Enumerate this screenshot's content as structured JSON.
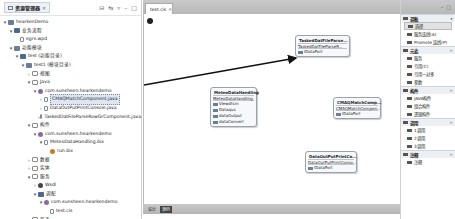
{
  "explorer": {
    "tab_label": "资源管理器",
    "tab_close": "✕",
    "toolbar_icons": [
      "collapse-all-icon",
      "link-editor-icon",
      "view-menu-icon",
      "minimize-icon",
      "maximize-icon"
    ],
    "tree": [
      {
        "indent": 0,
        "twisty": "▾",
        "icon": "project",
        "label": "hearkenDemo"
      },
      {
        "indent": 1,
        "twisty": "▾",
        "icon": "flow",
        "label": "业务流程"
      },
      {
        "indent": 2,
        "twisty": "",
        "icon": "file",
        "label": "egrs.wpd"
      },
      {
        "indent": 1,
        "twisty": "▾",
        "icon": "project",
        "label": "功能模块"
      },
      {
        "indent": 2,
        "twisty": "▾",
        "icon": "flow",
        "label": "test (功能目录)"
      },
      {
        "indent": 3,
        "twisty": "▾",
        "icon": "project",
        "label": "test1 (模块目录)"
      },
      {
        "indent": 4,
        "twisty": "›",
        "icon": "folder",
        "label": "视图"
      },
      {
        "indent": 4,
        "twisty": "▾",
        "icon": "folder",
        "label": "Java"
      },
      {
        "indent": 5,
        "twisty": "▾",
        "icon": "package",
        "label": "com.sunsheen.hearkendemo"
      },
      {
        "indent": 6,
        "twisty": "›",
        "icon": "file",
        "label": "CMAQMatchComponent.java",
        "selected": true
      },
      {
        "indent": 6,
        "twisty": "›",
        "icon": "file",
        "label": "DataOutPutPrintConsole.java"
      },
      {
        "indent": 6,
        "twisty": "›",
        "icon": "file",
        "label": "TaskedDatFileParseRowGrComponent.java"
      },
      {
        "indent": 4,
        "twisty": "▾",
        "icon": "folder",
        "label": "构件"
      },
      {
        "indent": 5,
        "twisty": "▾",
        "icon": "package",
        "label": "com.sunsheen.hearkendemo"
      },
      {
        "indent": 6,
        "twisty": "▾",
        "icon": "file",
        "label": "MeteoDataHandling.bix"
      },
      {
        "indent": 7,
        "twisty": "",
        "icon": "run",
        "label": "run.bix"
      },
      {
        "indent": 4,
        "twisty": "›",
        "icon": "folder",
        "label": "数据"
      },
      {
        "indent": 4,
        "twisty": "›",
        "icon": "folder",
        "label": "实体"
      },
      {
        "indent": 4,
        "twisty": "▾",
        "icon": "folder",
        "label": "服务"
      },
      {
        "indent": 5,
        "twisty": "›",
        "icon": "wall",
        "label": "Wsdl"
      },
      {
        "indent": 5,
        "twisty": "▾",
        "icon": "flow",
        "label": "调配"
      },
      {
        "indent": 6,
        "twisty": "▾",
        "icon": "package",
        "label": "com.sunsheen.hearkendemo"
      },
      {
        "indent": 7,
        "twisty": "",
        "icon": "file",
        "label": "test.cis"
      },
      {
        "indent": 4,
        "twisty": "›",
        "icon": "folder",
        "label": "报表"
      },
      {
        "indent": 4,
        "twisty": "›",
        "icon": "folder",
        "label": "配置"
      },
      {
        "indent": 1,
        "twisty": "▾",
        "icon": "folder",
        "label": "系统配置"
      },
      {
        "indent": 2,
        "twisty": "›",
        "icon": "folder",
        "label": "页面配置"
      },
      {
        "indent": 2,
        "twisty": "",
        "icon": "file",
        "label": "服务中心"
      }
    ]
  },
  "editor": {
    "tab_label": "test.cis",
    "tab_close": "✕",
    "components": [
      {
        "id": "tasked",
        "title": "TaskedDatFileParse...",
        "type": "TaskedDatFileParseR...",
        "ports": [
          "IDataPort"
        ]
      },
      {
        "id": "meteo",
        "title": "MeteoDataHandling",
        "type": "MeteoDataHandling",
        "ports": [
          "Viewdtsm",
          "Dataqus",
          "dataOutput",
          "dataConvert"
        ]
      },
      {
        "id": "cmaq",
        "title": "CMAQMatchComp...",
        "type": "CMAQMatchCompon...",
        "ports": [
          "IDataPort"
        ]
      },
      {
        "id": "dataout",
        "title": "DataOutPutPrintCo...",
        "type": "DataOutPutPrintConso...",
        "ports": [
          "IDataPort"
        ]
      }
    ],
    "bottom_tabs": [
      {
        "label": "设计",
        "active": false
      },
      {
        "label": "源码",
        "active": true
      }
    ]
  },
  "palette": {
    "top_icons": [
      "minimize-icon",
      "maximize-icon"
    ],
    "sections": [
      {
        "title": "调板",
        "chevron": "▸",
        "items": [
          {
            "label": "选择",
            "active": true
          },
          {
            "label": "服务连线(A)"
          },
          {
            "label": "Promote 连线(P)"
          }
        ]
      },
      {
        "title": "元素",
        "chevron": "≈",
        "items": [
          {
            "label": "服务"
          },
          {
            "label": "引用(C)"
          },
          {
            "label": "引用一对多"
          },
          {
            "label": "参数"
          }
        ]
      },
      {
        "title": "构件",
        "chevron": "≈",
        "items": [
          {
            "label": "JAVA构件"
          },
          {
            "label": "组合构件"
          },
          {
            "label": "逻辑构件"
          }
        ]
      },
      {
        "title": "调用",
        "chevron": "≈",
        "items": [
          {
            "label": "1调用"
          },
          {
            "label": "2调用"
          },
          {
            "label": "3调用"
          }
        ]
      },
      {
        "title": "注释",
        "chevron": "≈",
        "items": [
          {
            "label": "注释"
          }
        ]
      }
    ]
  },
  "colors": {
    "selection": "#dde6f2",
    "component_border": "#9aa3ad",
    "tabbar": "#c0c0c0"
  }
}
